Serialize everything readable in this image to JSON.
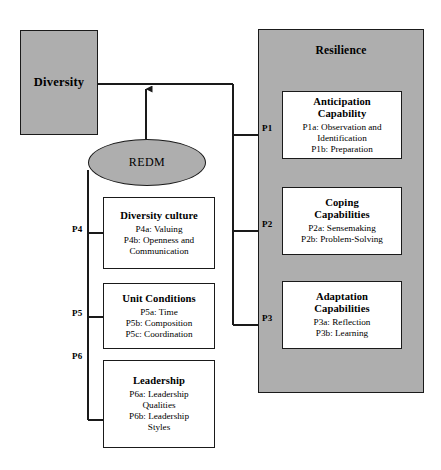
{
  "figure": {
    "type": "conceptual-framework-diagram",
    "colors": {
      "shaded_fill": "#aeaeae",
      "box_fill": "#ffffff",
      "stroke": "#1a1a1a",
      "background": "#ffffff"
    }
  },
  "antecedent": {
    "label": "Diversity"
  },
  "mediator": {
    "label": "REDM"
  },
  "outcome_container": {
    "title": "Resilience",
    "capabilities": [
      {
        "id": "anticipation",
        "title_line1": "Anticipation",
        "title_line2": "Capability",
        "propositions": [
          "P1a: Observation and",
          "Identification",
          "P1b: Preparation"
        ],
        "edge_label": "P1"
      },
      {
        "id": "coping",
        "title_line1": "Coping",
        "title_line2": "Capabilities",
        "propositions": [
          "P2a: Sensemaking",
          "P2b: Problem-Solving"
        ],
        "edge_label": "P2"
      },
      {
        "id": "adaptation",
        "title_line1": "Adaptation",
        "title_line2": "Capabilities",
        "propositions": [
          "P3a: Reflection",
          "P3b: Learning"
        ],
        "edge_label": "P3"
      }
    ]
  },
  "drivers": [
    {
      "id": "diversity-culture",
      "title": "Diversity culture",
      "propositions": [
        "P4a: Valuing",
        "P4b: Openness and",
        "Communication"
      ],
      "edge_label": "P4"
    },
    {
      "id": "unit-conditions",
      "title": "Unit Conditions",
      "propositions": [
        "P5a: Time",
        "P5b: Composition",
        "P5c: Coordination"
      ],
      "edge_label": "P5"
    },
    {
      "id": "leadership",
      "title": "Leadership",
      "propositions": [
        "P6a: Leadership",
        "Qualities",
        "P6b: Leadership",
        "Styles"
      ],
      "edge_label": "P6"
    }
  ]
}
